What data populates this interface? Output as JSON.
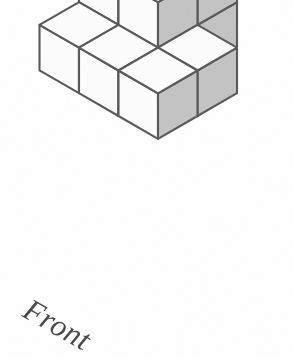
{
  "figure": {
    "type": "isometric-block-diagram",
    "unit_count": 14,
    "label_front": "Front",
    "colors": {
      "background": "#ffffff",
      "edge_stroke": "#5a5a5a",
      "top_face": "#fdfdfd",
      "left_face": "#fdfdfd",
      "right_face": "#c4c4c4"
    },
    "projection": {
      "half_width_px": 39.5,
      "half_height_px": 22.8,
      "cube_height_px": 45.5,
      "origin_x_px": 158,
      "origin_y_px": 2
    },
    "layout_note": "Cubes given as grid coordinates (col = toward lower-right, row = toward lower-left, level = upward).",
    "cubes": [
      {
        "col": 0,
        "row": 0,
        "level": 0
      },
      {
        "col": 0,
        "row": 0,
        "level": 1
      },
      {
        "col": 0,
        "row": 0,
        "level": 2
      },
      {
        "col": 1,
        "row": 0,
        "level": 0
      },
      {
        "col": 1,
        "row": 0,
        "level": 1
      },
      {
        "col": 1,
        "row": 0,
        "level": 2
      },
      {
        "col": 0,
        "row": 1,
        "level": 0
      },
      {
        "col": 0,
        "row": 1,
        "level": 1
      },
      {
        "col": 1,
        "row": 1,
        "level": 0
      },
      {
        "col": 1,
        "row": 1,
        "level": 1
      },
      {
        "col": 0,
        "row": 2,
        "level": 0
      },
      {
        "col": 1,
        "row": 2,
        "level": 0
      },
      {
        "col": 2,
        "row": 1,
        "level": 0
      },
      {
        "col": 2,
        "row": 2,
        "level": 0
      }
    ]
  }
}
